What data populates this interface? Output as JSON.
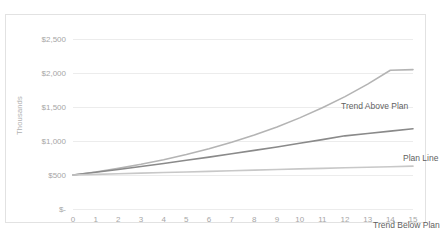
{
  "chart_data": {
    "type": "line",
    "title": "",
    "xlabel": "",
    "ylabel": "Thousands",
    "xlim": [
      0,
      15
    ],
    "ylim": [
      0,
      2500
    ],
    "grid": true,
    "legend_position": "inline-annotations",
    "x": [
      0,
      1,
      2,
      3,
      4,
      5,
      6,
      7,
      8,
      9,
      10,
      11,
      12,
      13,
      14,
      15
    ],
    "y_tick_labels": [
      "$-",
      "$500",
      "$1,000",
      "$1,500",
      "$2,000",
      "$2,500"
    ],
    "y_tick_values": [
      0,
      500,
      1000,
      1500,
      2000,
      2500
    ],
    "x_tick_labels": [
      "0",
      "1",
      "2",
      "3",
      "4",
      "5",
      "6",
      "7",
      "8",
      "9",
      "10",
      "11",
      "12",
      "13",
      "14",
      "15"
    ],
    "series": [
      {
        "name": "Trend Above Plan",
        "color": "#b4b4b4",
        "values": [
          500,
          545,
          598,
          657,
          725,
          801,
          886,
          981,
          1088,
          1207,
          1340,
          1488,
          1653,
          1836,
          2040,
          2050
        ]
      },
      {
        "name": "Plan Line",
        "color": "#8a8a8a",
        "values": [
          500,
          540,
          582,
          625,
          670,
          716,
          763,
          812,
          862,
          913,
          966,
          1020,
          1076,
          1110,
          1145,
          1180
        ]
      },
      {
        "name": "Trend Below Plan",
        "color": "#c8c8c8",
        "values": [
          500,
          509,
          518,
          527,
          536,
          545,
          554,
          563,
          572,
          581,
          590,
          598,
          606,
          614,
          622,
          630
        ]
      }
    ],
    "annotations": [
      {
        "text": "Trend Above Plan",
        "series": "Trend Above Plan"
      },
      {
        "text": "Plan Line",
        "series": "Plan Line"
      },
      {
        "text": "Trend Below Plan",
        "series": "Trend Below Plan"
      }
    ]
  },
  "colors": {
    "grid": "#ececec",
    "frame": "#e2e2e2",
    "tick_text": "#a6a6a6",
    "annotation_text": "#5f5f5f",
    "axis_title": "#b0b0b0"
  }
}
